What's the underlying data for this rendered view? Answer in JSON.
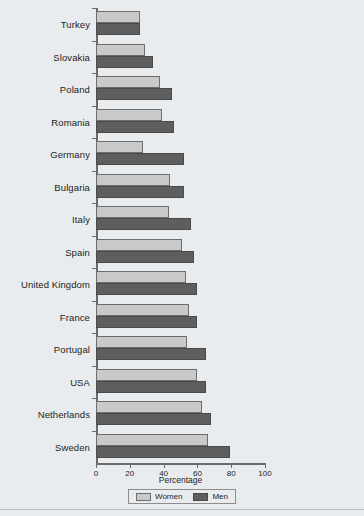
{
  "chart_data": {
    "type": "bar",
    "orientation": "horizontal",
    "title": "",
    "xlabel": "Percentage",
    "ylabel": "",
    "xlim": [
      0,
      100
    ],
    "xticks": [
      0,
      20,
      40,
      60,
      80,
      100
    ],
    "grid": false,
    "legend_position": "bottom",
    "categories": [
      "Turkey",
      "Slovakia",
      "Poland",
      "Romania",
      "Germany",
      "Bulgaria",
      "Italy",
      "Spain",
      "United Kingdom",
      "France",
      "Portugal",
      "USA",
      "Netherlands",
      "Sweden"
    ],
    "series": [
      {
        "name": "Women",
        "color": "#c9c9c9",
        "values": [
          26,
          29,
          38,
          39,
          28,
          44,
          43,
          51,
          53,
          55,
          54,
          60,
          63,
          66
        ]
      },
      {
        "name": "Men",
        "color": "#5e5e5e",
        "values": [
          26,
          34,
          45,
          46,
          52,
          52,
          56,
          58,
          60,
          60,
          65,
          65,
          68,
          79
        ]
      }
    ]
  },
  "axis": {
    "tick_labels": [
      "0",
      "20",
      "40",
      "60",
      "80",
      "100"
    ],
    "title": "Percentage"
  },
  "legend": {
    "items": [
      {
        "label": "Women"
      },
      {
        "label": "Men"
      }
    ]
  }
}
